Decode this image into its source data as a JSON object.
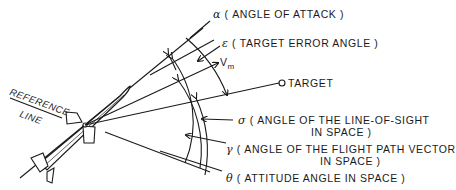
{
  "diagram": {
    "labels": {
      "alpha": {
        "symbol": "α",
        "text": "( ANGLE OF ATTACK )"
      },
      "epsilon": {
        "symbol": "ε",
        "text": "( TARGET ERROR ANGLE )"
      },
      "vm": {
        "symbol": "V",
        "subscript": "m"
      },
      "target": {
        "text": "TARGET"
      },
      "sigma": {
        "symbol": "σ",
        "text": "( ANGLE OF THE LINE-OF-SIGHT",
        "text2": "IN SPACE )"
      },
      "gamma": {
        "symbol": "γ",
        "text": "( ANGLE OF THE FLIGHT PATH VECTOR",
        "text2": "IN SPACE )"
      },
      "theta": {
        "symbol": "θ",
        "text": "( ATTITUDE ANGLE IN SPACE )"
      },
      "reference": {
        "line1": "REFERENCE",
        "line2": "LINE"
      }
    },
    "colors": {
      "ink": "#1a1a1a",
      "background": "#ffffff"
    }
  }
}
